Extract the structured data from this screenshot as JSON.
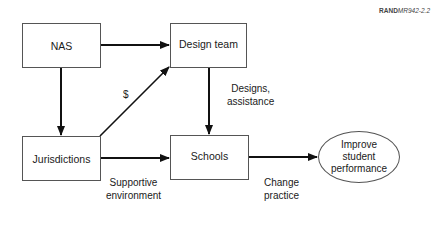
{
  "figure_ref": {
    "brand": "RAND",
    "code": "MR942-2.2"
  },
  "nodes": {
    "nas": "NAS",
    "design_team": "Design team",
    "jurisdictions": "Jurisdictions",
    "schools": "Schools",
    "outcome": "Improve student performance"
  },
  "edge_labels": {
    "money": "$",
    "designs_assistance": "Designs,\nassistance",
    "supportive_environment": "Supportive\nenvironment",
    "change_practice": "Change\npractice"
  },
  "edges": [
    {
      "from": "nas",
      "to": "design_team"
    },
    {
      "from": "nas",
      "to": "jurisdictions"
    },
    {
      "from": "jurisdictions",
      "to": "design_team",
      "label": "$"
    },
    {
      "from": "design_team",
      "to": "schools",
      "label": "Designs, assistance"
    },
    {
      "from": "jurisdictions",
      "to": "schools",
      "label": "Supportive environment"
    },
    {
      "from": "schools",
      "to": "outcome",
      "label": "Change practice"
    }
  ]
}
